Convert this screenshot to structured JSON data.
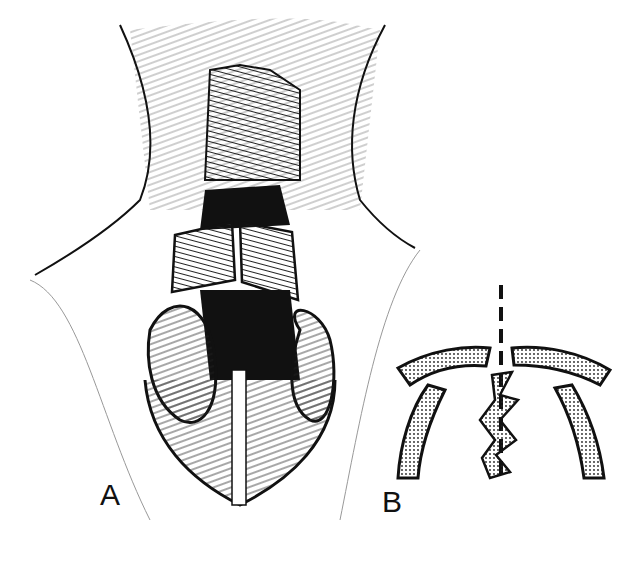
{
  "figure": {
    "panels": [
      {
        "label": "A",
        "description": "nasal dorsum exposure with separated upper lateral cartilages and septum"
      },
      {
        "label": "B",
        "description": "schematic cross-section of septum and lateral cartilages with midline dashed line"
      }
    ],
    "colors": {
      "ink": "#111111",
      "stipple_bg": "#ffffff"
    }
  }
}
